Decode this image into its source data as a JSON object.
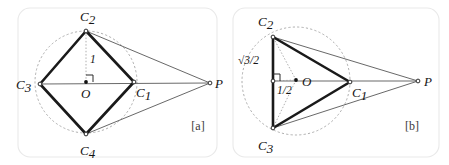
{
  "figure": {
    "background_color": "#ffffff",
    "panels": [
      {
        "tag": "[a]",
        "tag_pos": {
          "x": 198,
          "y": 130
        },
        "frame": {
          "x": 18,
          "y": 8,
          "w": 199,
          "h": 149,
          "r": 12
        },
        "shape": "square-inscribed-in-circle",
        "circle": {
          "cx": 86,
          "cy": 82,
          "r": 51,
          "style": "dashed"
        },
        "vertices": [
          {
            "name": "C_1",
            "label": "C",
            "subscript": "1",
            "x": 134,
            "y": 82,
            "label_x": 136,
            "label_y": 97,
            "marker": "open"
          },
          {
            "name": "C_2",
            "label": "C",
            "subscript": "2",
            "x": 86,
            "y": 31,
            "label_x": 80,
            "label_y": 21,
            "marker": "open"
          },
          {
            "name": "C_3",
            "label": "C",
            "subscript": "3",
            "x": 40,
            "y": 84,
            "label_x": 16,
            "label_y": 89,
            "marker": "open"
          },
          {
            "name": "C_4",
            "label": "C",
            "subscript": "4",
            "x": 86,
            "y": 134,
            "label_x": 80,
            "label_y": 155,
            "marker": "open"
          },
          {
            "name": "P",
            "label": "P",
            "subscript": "",
            "x": 210,
            "y": 83,
            "label_x": 215,
            "label_y": 88,
            "marker": "open"
          },
          {
            "name": "O",
            "label": "O",
            "subscript": "",
            "x": 86,
            "y": 82,
            "label_x": 81,
            "label_y": 98,
            "marker": "center"
          }
        ],
        "annotations": [
          {
            "name": "radius-length-label",
            "text": "1",
            "x": 90,
            "y": 63
          }
        ],
        "right_angle": {
          "x": 86,
          "y": 82,
          "size": 7,
          "dir_x": 1,
          "dir_y": -1
        }
      },
      {
        "tag": "[b]",
        "tag_pos": {
          "x": 412,
          "y": 130
        },
        "frame": {
          "x": 233,
          "y": 8,
          "w": 206,
          "h": 149,
          "r": 12
        },
        "shape": "equilateral-triangle-inscribed-in-circle",
        "circle": {
          "cx": 296,
          "cy": 81,
          "r": 54,
          "style": "dashed"
        },
        "vertices": [
          {
            "name": "C_1",
            "label": "C",
            "subscript": "1",
            "x": 350,
            "y": 82,
            "label_x": 352,
            "label_y": 97,
            "marker": "open"
          },
          {
            "name": "C_2",
            "label": "C",
            "subscript": "2",
            "x": 273,
            "y": 37,
            "label_x": 258,
            "label_y": 26,
            "marker": "open"
          },
          {
            "name": "C_3",
            "label": "C",
            "subscript": "3",
            "x": 273,
            "y": 128,
            "label_x": 258,
            "label_y": 150,
            "marker": "open"
          },
          {
            "name": "P",
            "label": "P",
            "subscript": "",
            "x": 418,
            "y": 81,
            "label_x": 424,
            "label_y": 86,
            "marker": "open"
          },
          {
            "name": "O",
            "label": "O",
            "subscript": "",
            "x": 296,
            "y": 80,
            "label_x": 302,
            "label_y": 86,
            "marker": "center"
          }
        ],
        "annotations": [
          {
            "name": "apothem-label",
            "text": "1/2",
            "numerator": "1",
            "denominator": "2",
            "x": 277,
            "y": 94
          },
          {
            "name": "half-side-label",
            "text": "√3/2",
            "radicand": "3",
            "denominator": "2",
            "x": 241,
            "y": 63
          }
        ],
        "right_angle": {
          "x": 273,
          "y": 81,
          "size": 7,
          "dir_x": 1,
          "dir_y": -1
        }
      }
    ],
    "colors": {
      "thick_stroke": "#1a1a1a",
      "thin_stroke": "#4d4d4d",
      "axis_stroke": "#6b6b6b",
      "dashed_stroke": "#9a9a9a",
      "frame_stroke": "#e9e9e9",
      "text": "#151515"
    }
  }
}
